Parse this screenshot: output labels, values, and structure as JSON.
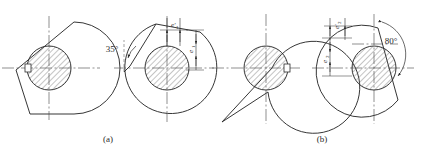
{
  "figure": {
    "background_color": "#ffffff",
    "line_color": "#2b2b2b",
    "hatch_color": "#555555",
    "centerline_color": "#444444"
  },
  "captions": [
    {
      "id": "caption-a",
      "label": "(a)"
    },
    {
      "id": "caption-b",
      "label": "(b)"
    }
  ],
  "groups": [
    {
      "id": "group-a",
      "caption": "(a)",
      "views": [
        {
          "id": "view-a1",
          "name": "cam-profile-a-left",
          "has_bore": true,
          "keyway_side": "left"
        },
        {
          "id": "view-a2",
          "name": "cam-profile-a-right",
          "has_bore": true,
          "keyway_side": "none"
        }
      ],
      "annotations": [
        {
          "id": "angle-a",
          "name": "angle-35",
          "text": "35°",
          "kind": "angle",
          "value": 35,
          "unit": "deg"
        },
        {
          "id": "dim-a-vert",
          "name": "eccentricity-e1-prime",
          "text": "e′₁",
          "kind": "linear",
          "orientation": "vertical-top"
        },
        {
          "id": "dim-a-horiz",
          "name": "eccentricity-e1",
          "text": "e₁",
          "kind": "linear",
          "orientation": "vertical-right"
        }
      ]
    },
    {
      "id": "group-b",
      "caption": "(b)",
      "views": [
        {
          "id": "view-b1",
          "name": "cam-profile-b-left",
          "has_bore": true,
          "keyway_side": "right"
        },
        {
          "id": "view-b2",
          "name": "cam-profile-b-right",
          "has_bore": true,
          "keyway_side": "none"
        }
      ],
      "annotations": [
        {
          "id": "angle-b",
          "name": "angle-80",
          "text": "80°",
          "kind": "angle",
          "value": 80,
          "unit": "deg"
        },
        {
          "id": "dim-b-top",
          "name": "eccentricity-e2-prime",
          "text": "e′₂",
          "kind": "linear",
          "orientation": "vertical-top"
        },
        {
          "id": "dim-b-left",
          "name": "eccentricity-e2",
          "text": "e₂",
          "kind": "linear",
          "orientation": "vertical-left"
        }
      ]
    }
  ],
  "labels": {
    "angle_35": "35°",
    "angle_80": "80°",
    "e1_prime": "e′",
    "e1_prime_sub": "1",
    "e1": "e",
    "e1_sub": "1",
    "e2_prime": "e′",
    "e2_prime_sub": "2",
    "e2": "e",
    "e2_sub": "2",
    "caption_a": "(a)",
    "caption_b": "(b)"
  }
}
